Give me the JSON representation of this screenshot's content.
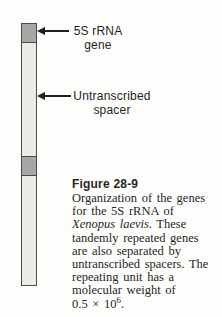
{
  "figure": {
    "diagram": {
      "bar": {
        "segments": [
          {
            "type": "gene",
            "label": "5S rRNA gene"
          },
          {
            "type": "spacer",
            "label": "Untranscribed spacer"
          },
          {
            "type": "gene",
            "label": "5S rRNA gene"
          },
          {
            "type": "spacer",
            "label": "Untranscribed spacer"
          }
        ]
      },
      "callouts": [
        {
          "line1": "5S rRNA",
          "line2": "gene"
        },
        {
          "line1": "Untranscribed",
          "line2": "spacer"
        }
      ]
    },
    "caption": {
      "label": "Figure 28-9",
      "lines": [
        {
          "segments": [
            {
              "text": "Organization of the genes"
            }
          ]
        },
        {
          "segments": [
            {
              "text": "for the 5S rRNA of"
            }
          ]
        },
        {
          "segments": [
            {
              "text": "Xenopus laevis",
              "italic": true
            },
            {
              "text": ". These"
            }
          ]
        },
        {
          "segments": [
            {
              "text": "tandemly repeated genes"
            }
          ]
        },
        {
          "segments": [
            {
              "text": "are also separated by"
            }
          ]
        },
        {
          "segments": [
            {
              "text": "untranscribed spacers. The"
            }
          ]
        },
        {
          "segments": [
            {
              "text": "repeating unit has a"
            }
          ]
        },
        {
          "segments": [
            {
              "text": "molecular weight of"
            }
          ]
        },
        {
          "segments": [
            {
              "text": "0.5 × 10"
            },
            {
              "text": "6",
              "superscript": true
            },
            {
              "text": "."
            }
          ]
        }
      ]
    }
  },
  "colors": {
    "background": "#fdfdfb",
    "gene_segment": "#a6a6a4",
    "spacer_segment": "#ebeae6",
    "bar_outline": "#4c4c4a",
    "label_text": "#1f1f1f",
    "caption_text": "#262624"
  }
}
